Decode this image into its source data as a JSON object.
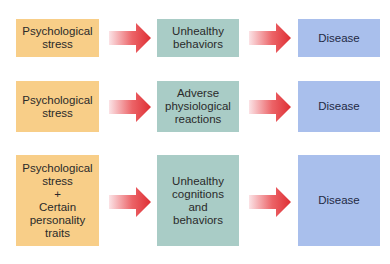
{
  "diagram": {
    "colors": {
      "cause": "#F8CE88",
      "mechanism": "#A9CCC6",
      "outcome": "#A9BFEC",
      "arrow": "#E0363A"
    },
    "rows": [
      {
        "cause": "Psychological\nstress",
        "mechanism": "Unhealthy\nbehaviors",
        "outcome": "Disease"
      },
      {
        "cause": "Psychological\nstress",
        "mechanism": "Adverse\nphysiological\nreactions",
        "outcome": "Disease"
      },
      {
        "cause": "Psychological\nstress\n+\nCertain\npersonality\ntraits",
        "mechanism": "Unhealthy\ncognitions\nand\nbehaviors",
        "outcome": "Disease"
      }
    ]
  }
}
